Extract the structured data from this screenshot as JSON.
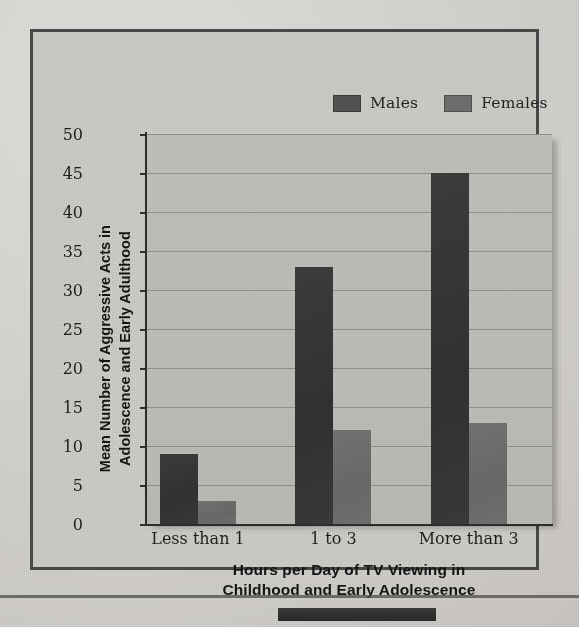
{
  "figure": {
    "legend": {
      "position": "top-right",
      "entries": [
        {
          "label": "Males",
          "color": "#3a3a3a"
        },
        {
          "label": "Females",
          "color": "#707070"
        }
      ]
    }
  },
  "chart_data": {
    "type": "bar",
    "title": "",
    "categories": [
      "Less than 1",
      "1 to 3",
      "More than 3"
    ],
    "series": [
      {
        "name": "Males",
        "values": [
          9,
          33,
          45
        ],
        "color": "#3a3a3a"
      },
      {
        "name": "Females",
        "values": [
          3,
          12,
          13
        ],
        "color": "#707070"
      }
    ],
    "xlabel": "Hours per Day of TV Viewing in Childhood and Early Adolescence",
    "xlabel_line1": "Hours per Day of TV Viewing in",
    "xlabel_line2": "Childhood and Early Adolescence",
    "ylabel": "Mean Number of Aggressive Acts in Adolescence and Early Adulthood",
    "ylabel_line1": "Mean Number of Aggressive Acts in",
    "ylabel_line2": "Adolescence and Early Adulthood",
    "ylim": [
      0,
      50
    ],
    "ytick_step": 5,
    "yticks": [
      0,
      5,
      10,
      15,
      20,
      25,
      30,
      35,
      40,
      45,
      50
    ],
    "grid": true,
    "grid_axis": "y",
    "legend_position": "top-right",
    "plot_background": "#c0beb9"
  }
}
